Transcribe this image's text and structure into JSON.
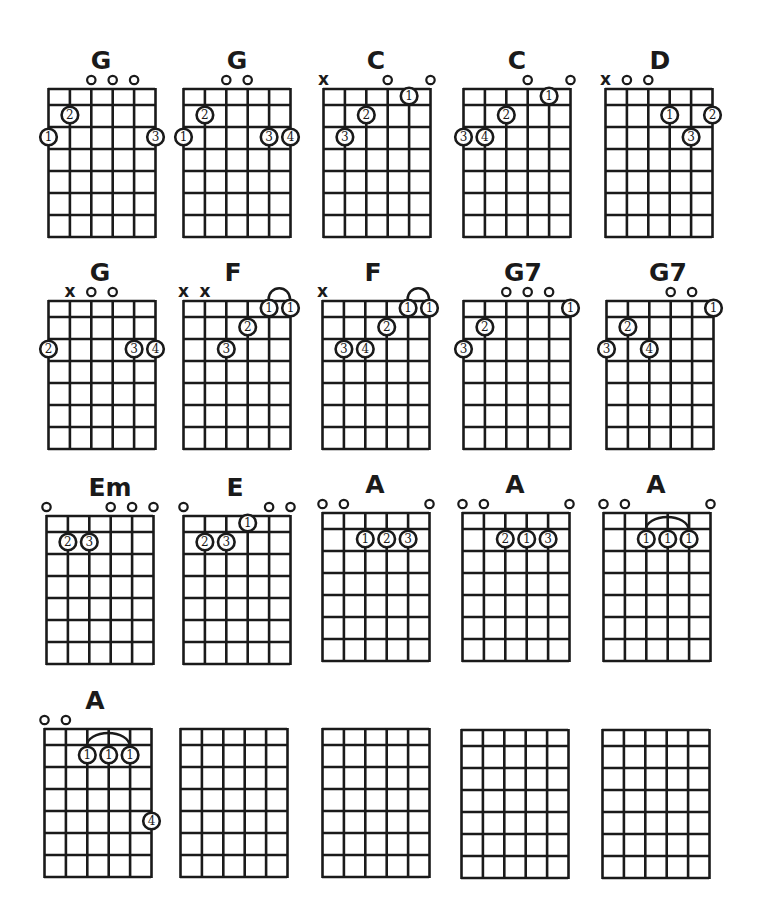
{
  "page": {
    "ink_color": "#1a1a1a",
    "background": "#ffffff"
  },
  "grid": {
    "strings": 6,
    "frets": 7,
    "width": 107,
    "first_row_height": 16,
    "row_height": 22
  },
  "chords": [
    {
      "name": "G",
      "x": 48,
      "y": 88,
      "label_x": 101,
      "markers": [
        "",
        "",
        "o",
        "o",
        "o",
        ""
      ],
      "dots": [
        {
          "s": 1,
          "f": 3,
          "n": "1"
        },
        {
          "s": 2,
          "f": 2,
          "n": "2"
        },
        {
          "s": 6,
          "f": 3,
          "n": "3"
        }
      ],
      "barre": null
    },
    {
      "name": "G",
      "x": 183,
      "y": 88,
      "label_x": 237,
      "markers": [
        "",
        "",
        "o",
        "o",
        "",
        ""
      ],
      "dots": [
        {
          "s": 1,
          "f": 3,
          "n": "1"
        },
        {
          "s": 2,
          "f": 2,
          "n": "2"
        },
        {
          "s": 5,
          "f": 3,
          "n": "3"
        },
        {
          "s": 6,
          "f": 3,
          "n": "4"
        }
      ],
      "barre": null
    },
    {
      "name": "C",
      "x": 323,
      "y": 88,
      "label_x": 376,
      "markers": [
        "x",
        "",
        "",
        "o",
        "",
        "o"
      ],
      "dots": [
        {
          "s": 2,
          "f": 3,
          "n": "3"
        },
        {
          "s": 3,
          "f": 2,
          "n": "2"
        },
        {
          "s": 5,
          "f": 1,
          "n": "1"
        }
      ],
      "barre": null
    },
    {
      "name": "C",
      "x": 463,
      "y": 88,
      "label_x": 517,
      "markers": [
        "",
        "",
        "",
        "o",
        "",
        "o"
      ],
      "dots": [
        {
          "s": 1,
          "f": 3,
          "n": "3"
        },
        {
          "s": 2,
          "f": 3,
          "n": "4"
        },
        {
          "s": 3,
          "f": 2,
          "n": "2"
        },
        {
          "s": 5,
          "f": 1,
          "n": "1"
        }
      ],
      "barre": null
    },
    {
      "name": "D",
      "x": 605,
      "y": 88,
      "label_x": 660,
      "markers": [
        "x",
        "o",
        "o",
        "",
        "",
        ""
      ],
      "dots": [
        {
          "s": 4,
          "f": 2,
          "n": "1"
        },
        {
          "s": 6,
          "f": 2,
          "n": "2"
        },
        {
          "s": 5,
          "f": 3,
          "n": "3"
        }
      ],
      "barre": null
    },
    {
      "name": "G",
      "x": 48,
      "y": 300,
      "label_x": 100,
      "markers": [
        "",
        "x",
        "o",
        "o",
        "",
        ""
      ],
      "dots": [
        {
          "s": 1,
          "f": 3,
          "n": "2"
        },
        {
          "s": 5,
          "f": 3,
          "n": "3"
        },
        {
          "s": 6,
          "f": 3,
          "n": "4"
        }
      ],
      "barre": null
    },
    {
      "name": "F",
      "x": 183,
      "y": 300,
      "label_x": 233,
      "markers": [
        "x",
        "x",
        "",
        "",
        "",
        ""
      ],
      "dots": [
        {
          "s": 5,
          "f": 1,
          "n": "1"
        },
        {
          "s": 6,
          "f": 1,
          "n": "1"
        },
        {
          "s": 4,
          "f": 2,
          "n": "2"
        },
        {
          "s": 3,
          "f": 3,
          "n": "3"
        }
      ],
      "barre": {
        "from": 5,
        "to": 6,
        "f": 1
      }
    },
    {
      "name": "F",
      "x": 322,
      "y": 300,
      "label_x": 373,
      "markers": [
        "x",
        "",
        "",
        "",
        "",
        ""
      ],
      "dots": [
        {
          "s": 5,
          "f": 1,
          "n": "1"
        },
        {
          "s": 6,
          "f": 1,
          "n": "1"
        },
        {
          "s": 4,
          "f": 2,
          "n": "2"
        },
        {
          "s": 2,
          "f": 3,
          "n": "3"
        },
        {
          "s": 3,
          "f": 3,
          "n": "4"
        }
      ],
      "barre": {
        "from": 5,
        "to": 6,
        "f": 1
      }
    },
    {
      "name": "G7",
      "x": 463,
      "y": 300,
      "label_x": 523,
      "markers": [
        "",
        "",
        "o",
        "o",
        "o",
        ""
      ],
      "dots": [
        {
          "s": 6,
          "f": 1,
          "n": "1"
        },
        {
          "s": 2,
          "f": 2,
          "n": "2"
        },
        {
          "s": 1,
          "f": 3,
          "n": "3"
        }
      ],
      "barre": null
    },
    {
      "name": "G7",
      "x": 606,
      "y": 300,
      "label_x": 668,
      "markers": [
        "",
        "",
        "",
        "o",
        "o",
        ""
      ],
      "dots": [
        {
          "s": 6,
          "f": 1,
          "n": "1"
        },
        {
          "s": 2,
          "f": 2,
          "n": "2"
        },
        {
          "s": 1,
          "f": 3,
          "n": "3"
        },
        {
          "s": 3,
          "f": 3,
          "n": "4"
        }
      ],
      "barre": null
    },
    {
      "name": "Em",
      "x": 46,
      "y": 515,
      "label_x": 110,
      "markers": [
        "o",
        "",
        "",
        "o",
        "o",
        "o"
      ],
      "dots": [
        {
          "s": 2,
          "f": 2,
          "n": "2"
        },
        {
          "s": 3,
          "f": 2,
          "n": "3"
        }
      ],
      "barre": null
    },
    {
      "name": "E",
      "x": 183,
      "y": 515,
      "label_x": 235,
      "markers": [
        "o",
        "",
        "",
        "",
        "o",
        "o"
      ],
      "dots": [
        {
          "s": 4,
          "f": 1,
          "n": "1"
        },
        {
          "s": 2,
          "f": 2,
          "n": "2"
        },
        {
          "s": 3,
          "f": 2,
          "n": "3"
        }
      ],
      "barre": null
    },
    {
      "name": "A",
      "x": 322,
      "y": 512,
      "label_x": 375,
      "markers": [
        "o",
        "o",
        "",
        "",
        "",
        "o"
      ],
      "dots": [
        {
          "s": 3,
          "f": 2,
          "n": "1"
        },
        {
          "s": 4,
          "f": 2,
          "n": "2"
        },
        {
          "s": 5,
          "f": 2,
          "n": "3"
        }
      ],
      "barre": null
    },
    {
      "name": "A",
      "x": 462,
      "y": 512,
      "label_x": 515,
      "markers": [
        "o",
        "o",
        "",
        "",
        "",
        "o"
      ],
      "dots": [
        {
          "s": 3,
          "f": 2,
          "n": "2"
        },
        {
          "s": 4,
          "f": 2,
          "n": "1"
        },
        {
          "s": 5,
          "f": 2,
          "n": "3"
        }
      ],
      "barre": null
    },
    {
      "name": "A",
      "x": 603,
      "y": 512,
      "label_x": 656,
      "markers": [
        "o",
        "o",
        "",
        "",
        "",
        "o"
      ],
      "dots": [
        {
          "s": 3,
          "f": 2,
          "n": "1"
        },
        {
          "s": 4,
          "f": 2,
          "n": "1"
        },
        {
          "s": 5,
          "f": 2,
          "n": "1"
        }
      ],
      "barre": {
        "from": 3,
        "to": 5,
        "f": 2
      }
    },
    {
      "name": "A",
      "x": 44,
      "y": 728,
      "label_x": 95,
      "markers": [
        "o",
        "o",
        "",
        "",
        "",
        ""
      ],
      "dots": [
        {
          "s": 3,
          "f": 2,
          "n": "1"
        },
        {
          "s": 4,
          "f": 2,
          "n": "1"
        },
        {
          "s": 5,
          "f": 2,
          "n": "1"
        },
        {
          "s": 6,
          "f": 5,
          "n": "4"
        }
      ],
      "barre": {
        "from": 3,
        "to": 5,
        "f": 2
      }
    },
    {
      "name": "",
      "x": 180,
      "y": 728,
      "label_x": 0,
      "markers": [
        "",
        "",
        "",
        "",
        "",
        ""
      ],
      "dots": [],
      "barre": null
    },
    {
      "name": "",
      "x": 322,
      "y": 728,
      "label_x": 0,
      "markers": [
        "",
        "",
        "",
        "",
        "",
        ""
      ],
      "dots": [],
      "barre": null
    },
    {
      "name": "",
      "x": 461,
      "y": 729,
      "label_x": 0,
      "markers": [
        "",
        "",
        "",
        "",
        "",
        ""
      ],
      "dots": [],
      "barre": null
    },
    {
      "name": "",
      "x": 602,
      "y": 729,
      "label_x": 0,
      "markers": [
        "",
        "",
        "",
        "",
        "",
        ""
      ],
      "dots": [],
      "barre": null
    }
  ]
}
